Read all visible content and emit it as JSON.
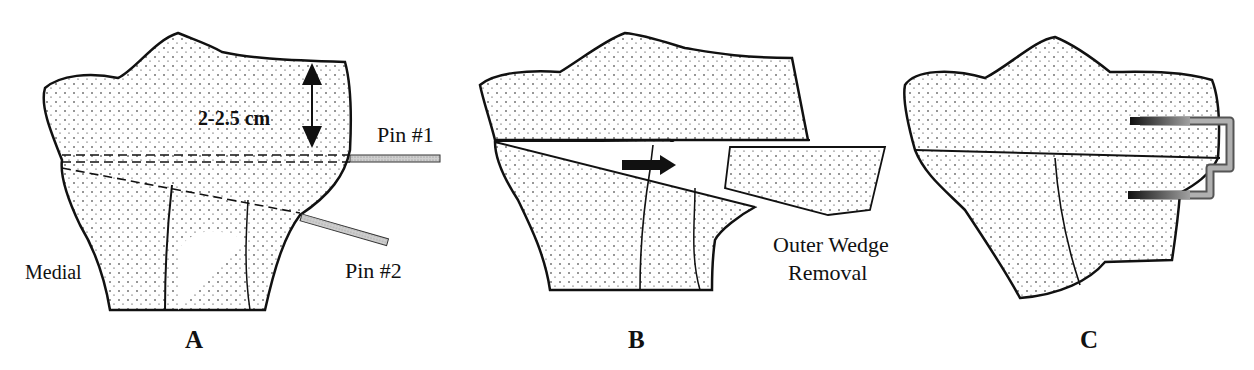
{
  "figure": {
    "panels": [
      {
        "id": "A",
        "letter": "A",
        "labels": {
          "measurement": "2-2.5 cm",
          "pin1": "Pin  #1",
          "pin2": "Pin  #2",
          "side": "Medial"
        }
      },
      {
        "id": "B",
        "letter": "B",
        "labels": {
          "wedge_line1": "Outer Wedge",
          "wedge_line2": "Removal"
        }
      },
      {
        "id": "C",
        "letter": "C",
        "labels": {}
      }
    ],
    "colors": {
      "ink": "#111111",
      "pin_fill": "#b8b8b8",
      "staple_fill": "#9a9a9a",
      "background": "#ffffff"
    }
  }
}
